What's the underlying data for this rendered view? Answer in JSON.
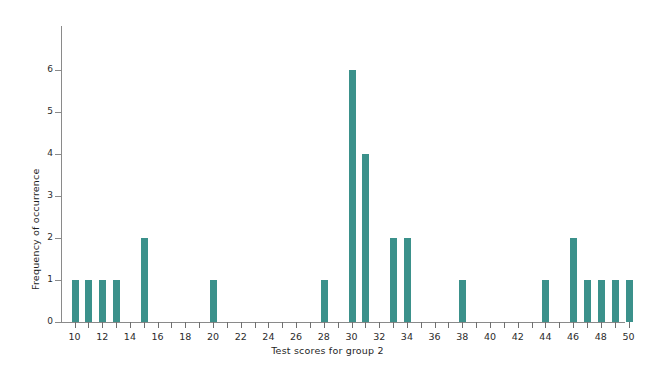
{
  "chart_data": {
    "type": "bar",
    "title": "",
    "xlabel": "Test scores for group 2",
    "ylabel": "Frequency of occurrence",
    "xlim": [
      9,
      51
    ],
    "ylim": [
      0,
      6.6
    ],
    "grid": false,
    "legend": null,
    "bar_color": "#3b918b",
    "axis_color": "#8a8a8a",
    "x_tick_step": 1,
    "x_label_step": 2,
    "x_ticks": [
      10,
      11,
      12,
      13,
      14,
      15,
      16,
      17,
      18,
      19,
      20,
      21,
      22,
      23,
      24,
      25,
      26,
      27,
      28,
      29,
      30,
      31,
      32,
      33,
      34,
      35,
      36,
      37,
      38,
      39,
      40,
      41,
      42,
      43,
      44,
      45,
      46,
      47,
      48,
      49,
      50
    ],
    "x_tick_labels": [
      "10",
      "12",
      "14",
      "16",
      "18",
      "20",
      "22",
      "24",
      "26",
      "28",
      "30",
      "32",
      "34",
      "36",
      "38",
      "40",
      "42",
      "44",
      "46",
      "48",
      "50"
    ],
    "y_ticks": [
      0,
      1,
      2,
      3,
      4,
      5,
      6
    ],
    "y_tick_labels": [
      "0",
      "1",
      "2",
      "3",
      "4",
      "5",
      "6"
    ],
    "categories": [
      10,
      11,
      12,
      13,
      14,
      15,
      16,
      17,
      18,
      19,
      20,
      21,
      22,
      23,
      24,
      25,
      26,
      27,
      28,
      29,
      30,
      31,
      32,
      33,
      34,
      35,
      36,
      37,
      38,
      39,
      40,
      41,
      42,
      43,
      44,
      45,
      46,
      47,
      48,
      49,
      50
    ],
    "values": [
      1,
      1,
      1,
      1,
      0,
      2,
      0,
      0,
      0,
      0,
      1,
      0,
      0,
      0,
      0,
      0,
      0,
      0,
      1,
      0,
      6,
      4,
      0,
      2,
      2,
      0,
      0,
      0,
      1,
      0,
      0,
      0,
      0,
      0,
      1,
      0,
      2,
      1,
      1,
      1,
      1
    ]
  }
}
